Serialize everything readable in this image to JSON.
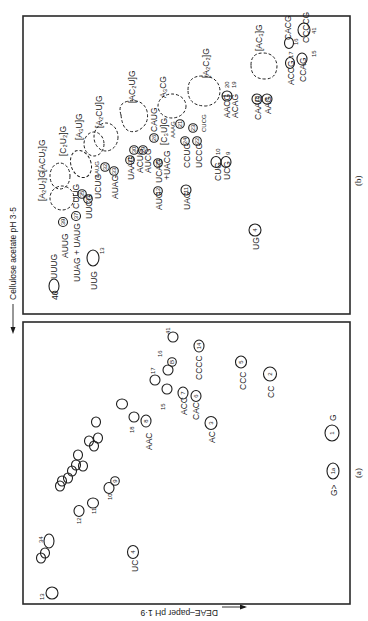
{
  "figure": {
    "orientation": "rotated 90 degrees (text reads bottom-to-top)",
    "axes": {
      "horizontal_axis_label": "Cellulose acetate pH 3·5",
      "vertical_axis_label": "DEAE–paper pH 1·9"
    },
    "panels": [
      {
        "label": "(b)",
        "spots": [
          {
            "label": "UUUG",
            "number": "40",
            "shape": "open"
          },
          {
            "label": "UUG",
            "number": "13",
            "shape": "open"
          },
          {
            "label": "AUUG",
            "number": "39",
            "shape": "circled"
          },
          {
            "label": "UUAG + UAUG",
            "number": "37",
            "shape": "circled"
          },
          {
            "label": "CUUG",
            "number": "",
            "shape": "text"
          },
          {
            "label": "UUCG",
            "number": "36",
            "shape": "circled"
          },
          {
            "label": "UCUG",
            "number": "34",
            "shape": "circled"
          },
          {
            "label": "AAUG",
            "number": "",
            "shape": "text"
          },
          {
            "label": "AUAG",
            "number": "33",
            "shape": "circled"
          },
          {
            "label": "",
            "number": "32",
            "shape": "circled"
          },
          {
            "label": "[A2U2]G",
            "number": "",
            "shape": "dashed"
          },
          {
            "label": "[ACU2]G",
            "number": "",
            "shape": "dashed"
          },
          {
            "label": "[C2U2]G",
            "number": "",
            "shape": "dashed"
          },
          {
            "label": "[A3U]G",
            "number": "",
            "shape": "dashed"
          },
          {
            "label": "[A2CU]G",
            "number": "",
            "shape": "dashed"
          },
          {
            "label": "[AC2U]G",
            "number": "",
            "shape": "dashed"
          },
          {
            "label": "UAAG",
            "number": "31",
            "shape": "circled"
          },
          {
            "label": "ACUG",
            "number": "30",
            "shape": "circled"
          },
          {
            "label": "AUCG",
            "number": "29",
            "shape": "circled"
          },
          {
            "label": "AUG",
            "number": "12",
            "shape": "circled"
          },
          {
            "label": "UCAG",
            "number": "25",
            "shape": "circled"
          },
          {
            "label": "+UACG",
            "number": "",
            "shape": "text"
          },
          {
            "label": "CAUG",
            "number": "26",
            "shape": "circled"
          },
          {
            "label": "[C3U]G",
            "number": "",
            "shape": "text"
          },
          {
            "label": "AAAG",
            "number": "",
            "shape": "text"
          },
          {
            "label": "A3CG",
            "number": "",
            "shape": "dashed"
          },
          {
            "label": "UAG",
            "number": "11",
            "shape": "circled"
          },
          {
            "label": "CCUG",
            "number": "24",
            "shape": "circled"
          },
          {
            "label": "UCCG",
            "number": "22",
            "shape": "circled"
          },
          {
            "label": "",
            "number": "21",
            "shape": "circled"
          },
          {
            "label": "",
            "number": "23",
            "shape": "circled"
          },
          {
            "label": "CUCG",
            "number": "",
            "shape": "text"
          },
          {
            "label": "[A2C2]G",
            "number": "",
            "shape": "dashed"
          },
          {
            "label": "UG",
            "number": "4",
            "shape": "circled"
          },
          {
            "label": "CUG",
            "number": "10",
            "shape": "open"
          },
          {
            "label": "UCG",
            "number": "9",
            "shape": "open"
          },
          {
            "label": "AACG",
            "number": "20",
            "shape": "open"
          },
          {
            "label": "ACAG",
            "number": "19",
            "shape": "open"
          },
          {
            "label": "CAAG",
            "number": "18",
            "shape": "circled"
          },
          {
            "label": "AAG",
            "number": "8",
            "shape": "circled"
          },
          {
            "label": "[AC3]G",
            "number": "",
            "shape": "dashed"
          },
          {
            "label": "ACCG",
            "number": "17",
            "shape": "open"
          },
          {
            "label": "CCAG",
            "number": "15",
            "shape": "open"
          },
          {
            "label": "CACG",
            "number": "16",
            "shape": "open"
          },
          {
            "label": "CCCCG",
            "number": "41",
            "shape": "open"
          }
        ]
      },
      {
        "label": "(a)",
        "spots": [
          {
            "label": "",
            "number": "13",
            "shape": "open"
          },
          {
            "label": "",
            "number": "34",
            "shape": "open"
          },
          {
            "label": "UC",
            "number": "4",
            "shape": "circled"
          },
          {
            "label": "",
            "number": "12",
            "shape": "open"
          },
          {
            "label": "",
            "number": "11",
            "shape": "open"
          },
          {
            "label": "",
            "number": "10",
            "shape": "open"
          },
          {
            "label": "",
            "number": "9",
            "shape": "circled"
          },
          {
            "label": "",
            "number": "18",
            "shape": "open"
          },
          {
            "label": "AAC",
            "number": "8",
            "shape": "circled"
          },
          {
            "label": "",
            "number": "15",
            "shape": "open"
          },
          {
            "label": "",
            "number": "17",
            "shape": "open"
          },
          {
            "label": "",
            "number": "16",
            "shape": "open"
          },
          {
            "label": "",
            "number": "B",
            "shape": "circled"
          },
          {
            "label": "",
            "number": "41",
            "shape": "open"
          },
          {
            "label": "ACC",
            "number": "7",
            "shape": "circled"
          },
          {
            "label": "CAC",
            "number": "6",
            "shape": "circled"
          },
          {
            "label": "AC",
            "number": "3",
            "shape": "circled"
          },
          {
            "label": "CCCC",
            "number": "14",
            "shape": "circled"
          },
          {
            "label": "CCC",
            "number": "5",
            "shape": "circled"
          },
          {
            "label": "CC",
            "number": "2",
            "shape": "circled"
          },
          {
            "label": "G>",
            "number": "1a",
            "shape": "circled"
          },
          {
            "label": "G",
            "number": "1",
            "shape": "circled"
          }
        ]
      }
    ]
  },
  "text": {
    "axis_h": "Cellulose acetate pH 3·5",
    "axis_v": "DEAE–paper pH 1·9",
    "panel_b": "(b)",
    "panel_a": "(a)",
    "b": {
      "uuug": "UUUG",
      "n40": "40",
      "uug": "UUG",
      "n13": "13",
      "auug": "AUUG",
      "n39": "39",
      "uuag": "UUAG + UAUG",
      "n37": "37",
      "cuug": "CUUG",
      "uucg": "UUCG",
      "n36": "36",
      "n35": "35",
      "ucug": "UCUG",
      "aaug": "AAUG",
      "auag": "AUAG",
      "n33": "33",
      "n32": "32",
      "a2u2": "[A₂U₂]G",
      "acu2": "[ACU₂]G",
      "c2u2": "[C₂U₂]G",
      "a3u": "[A₃U]G",
      "a2cu": "[A₂CU]G",
      "ac2u": "[AC₂U]G",
      "uaag": "UAAG",
      "n31": "31",
      "acug": "ACUG",
      "n30": "30",
      "aucg": "AUCG",
      "n29": "29",
      "aug": "AUG",
      "n12": "12",
      "ucag": "UCAG",
      "n25": "25",
      "uacg": "+UACG",
      "caug": "CAUG",
      "n26": "26",
      "c3u": "[C₃U]G",
      "aaag": "AAAG",
      "a3cg": "A₃CG",
      "uag": "UAG",
      "n11": "11",
      "ccug": "CCUG",
      "n24": "24",
      "uccg": "UCCG",
      "n22": "22",
      "n21": "21",
      "n23": "23",
      "cucg": "CUCG",
      "a2c2": "[A₂C₂]G",
      "ug": "UG",
      "n4": "4",
      "cug": "CUG",
      "n10": "10",
      "ucg": "UCG",
      "n9": "9",
      "aacg": "AACG",
      "n20": "20",
      "acag": "ACAG",
      "n19": "19",
      "caag": "CAAG",
      "n18": "18",
      "aag": "AAG",
      "n8": "8",
      "ac3": "[AC₃]G",
      "accg": "ACCG",
      "n17": "17",
      "ccag": "CCAG",
      "n15": "15",
      "cacg": "CACG",
      "n16": "16",
      "cccc": "CCCCG",
      "n41": "41"
    },
    "a": {
      "n13": "13",
      "n34": "34",
      "uc": "UC",
      "n4": "4",
      "n12": "12",
      "n11": "11",
      "n10": "10",
      "n9": "9",
      "n18": "18",
      "aac": "AAC",
      "n8": "8",
      "n15": "15",
      "n17": "17",
      "n16": "16",
      "nB": "B",
      "n41": "41",
      "acc": "ACC",
      "n7": "7",
      "cac": "CAC",
      "n6": "6",
      "ac": "AC",
      "n3": "3",
      "cccc": "CCCC",
      "n14": "14",
      "ccc": "CCC",
      "n5": "5",
      "cc": "CC",
      "n2": "2",
      "gcyc": "G>",
      "n1a": "1a",
      "g": "G",
      "n1": "1"
    }
  }
}
